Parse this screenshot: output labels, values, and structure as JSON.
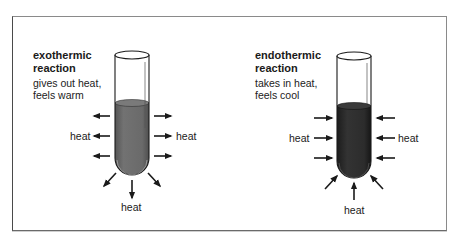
{
  "figure": {
    "colors": {
      "exothermic_liquid": "#6b6b6b",
      "endothermic_liquid": "#2b2b2b",
      "arrow": "#1a1a1a",
      "glass_outline": "#1a1a1a"
    },
    "panels": [
      {
        "id": "exothermic",
        "title_line1": "exothermic",
        "title_line2": "reaction",
        "desc_line1": "gives out heat,",
        "desc_line2": "feels warm",
        "arrow_direction": "outward",
        "labels": {
          "left": "heat",
          "right": "heat",
          "bottom": "heat"
        }
      },
      {
        "id": "endothermic",
        "title_line1": "endothermic",
        "title_line2": "reaction",
        "desc_line1": "takes in heat,",
        "desc_line2": "feels cool",
        "arrow_direction": "inward",
        "labels": {
          "left": "heat",
          "right": "heat",
          "bottom": "heat"
        }
      }
    ]
  }
}
